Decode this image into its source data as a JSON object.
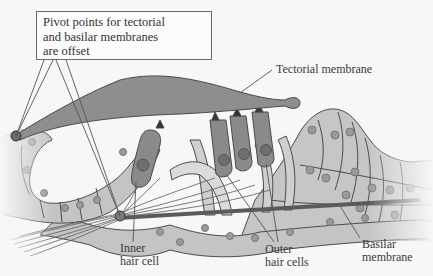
{
  "diagram": {
    "top_partial_text": "",
    "callout": {
      "lines": [
        "Pivot points for tectorial",
        "and basilar membranes",
        "are offset"
      ]
    },
    "labels": {
      "tectorial_membrane": "Tectorial membrane",
      "inner_hair_cell_line1": "Inner",
      "inner_hair_cell_line2": "hair cell",
      "outer_hair_cells_line1": "Outer",
      "outer_hair_cells_line2": "hair cells",
      "basilar_membrane_line1": "Basilar",
      "basilar_membrane_line2": "membrane"
    },
    "colors": {
      "background": "#f7f7f7",
      "tectorial_membrane": "#8e8e8e",
      "hair_cell": "#8a8a8a",
      "support_cell": "#c4c4c4",
      "nucleus": "#9a9a9a",
      "outline": "#4a4a4a",
      "basilar_membrane": "#6a6a6a",
      "label_text": "#3a3a3a"
    }
  }
}
